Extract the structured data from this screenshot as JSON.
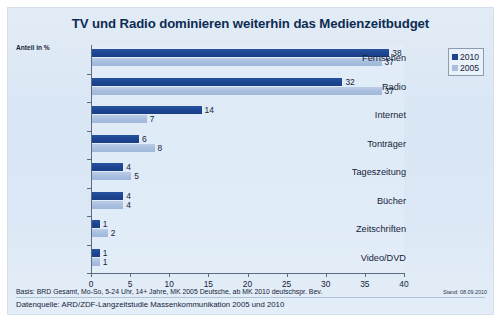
{
  "chart_data": {
    "type": "bar",
    "orientation": "horizontal",
    "title": "TV und Radio dominieren weiterhin das Medienzeitbudget",
    "unit_label": "Anteil in %",
    "xlabel": "",
    "ylabel": "",
    "xlim": [
      0,
      40
    ],
    "xticks": [
      0,
      5,
      10,
      15,
      20,
      25,
      30,
      35,
      40
    ],
    "grid": false,
    "legend_position": "top-right",
    "categories": [
      "Fernsehen",
      "Radio",
      "Internet",
      "Tonträger",
      "Tageszeitung",
      "Bücher",
      "Zeitschriften",
      "Video/DVD"
    ],
    "series": [
      {
        "name": "2010",
        "color": "#1c4490",
        "values": [
          38,
          32,
          14,
          6,
          4,
          4,
          1,
          1
        ]
      },
      {
        "name": "2005",
        "color": "#a8bedf",
        "values": [
          37,
          37,
          7,
          8,
          5,
          4,
          2,
          1
        ]
      }
    ],
    "footnote_basis": "Basis: BRD Gesamt, Mo-So, 5-24 Uhr, 14+ Jahre, MK 2005 Deutsche, ab MK 2010 deutschspr. Bev.",
    "footnote_stand": "Stand: 08.09.2010",
    "footnote_source": "Datenquelle: ARD/ZDF-Langzeitstudie Massenkommunikation 2005 und 2010"
  }
}
